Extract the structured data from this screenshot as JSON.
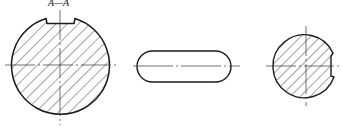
{
  "drawing": {
    "section_label": "A—A",
    "views": [
      {
        "name": "shaft-section-with-keyway",
        "type": "hatched circular section",
        "keyway": "top"
      },
      {
        "name": "key-slot-oblong",
        "type": "rounded slot outline"
      },
      {
        "name": "shaft-section-with-side-notch",
        "type": "hatched circular section",
        "notch": "right"
      }
    ],
    "colors": {
      "line": "#1a1a1a",
      "hatch": "#333333",
      "background": "#ffffff"
    }
  }
}
